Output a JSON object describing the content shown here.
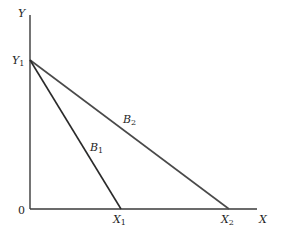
{
  "diagram": {
    "type": "budget-constraint",
    "colors": {
      "axis": "#3a3a3a",
      "line_b1": "#2a2a2a",
      "line_b2": "#4a4a4a",
      "text": "#1e1e1e"
    },
    "axes": {
      "y_label": {
        "base": "Y",
        "sub": ""
      },
      "x_label": {
        "base": "X",
        "sub": ""
      },
      "origin_label": "0"
    },
    "points": {
      "y1": {
        "base": "Y",
        "sub": "1"
      },
      "x1": {
        "base": "X",
        "sub": "1"
      },
      "x2": {
        "base": "X",
        "sub": "2"
      }
    },
    "lines": [
      {
        "id": "B1",
        "label": {
          "base": "B",
          "sub": "1"
        },
        "from": "Y1",
        "to": "X1"
      },
      {
        "id": "B2",
        "label": {
          "base": "B",
          "sub": "2"
        },
        "from": "Y1",
        "to": "X2"
      }
    ]
  }
}
